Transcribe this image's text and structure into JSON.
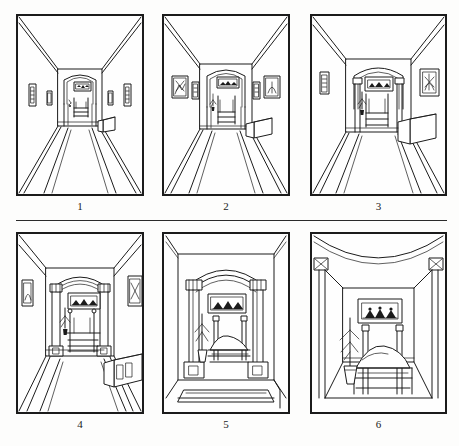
{
  "figure": {
    "style": "black ink line drawing on white",
    "panel_count": 6,
    "columns": 3,
    "rows": 2,
    "ink_color": "#1b1b1b",
    "paper_color": "#fefefe",
    "page_color": "#fdfdfc"
  },
  "panels": [
    {
      "id": "panel-1",
      "caption": "1",
      "scene": "long corridor, distant arched doorway at far end",
      "viewpoint": "farthest from bedroom",
      "elements": [
        "ceiling",
        "left wall",
        "right wall",
        "floor",
        "runner rug",
        "arched doorway",
        "framed picture over bed",
        "bed",
        "four wall pictures",
        "low chest on right"
      ]
    },
    {
      "id": "panel-2",
      "caption": "2",
      "scene": "corridor, one step closer, doorway larger",
      "viewpoint": "approaching",
      "elements": [
        "ceiling",
        "left wall",
        "right wall",
        "floor",
        "runner rug",
        "arched doorway",
        "framed picture over bed",
        "bed",
        "hanging plant",
        "four wall pictures",
        "low chest on right"
      ]
    },
    {
      "id": "panel-3",
      "caption": "3",
      "scene": "corridor, doorway with visible columns and capitals",
      "viewpoint": "closer",
      "elements": [
        "ceiling",
        "left wall",
        "right wall",
        "floor",
        "runner rug",
        "columned arched doorway",
        "framed picture",
        "bed",
        "hanging plant",
        "two wall pictures",
        "chest on right"
      ]
    },
    {
      "id": "panel-4",
      "caption": "4",
      "scene": "doorway fills middle of view, bed clearly visible",
      "viewpoint": "at threshold approach",
      "elements": [
        "ceiling",
        "left wall",
        "right wall",
        "floor",
        "runner rug",
        "columned arched doorway",
        "framed picture",
        "bed with posts",
        "hanging plant",
        "two wall pictures",
        "panelled chest on right"
      ]
    },
    {
      "id": "panel-5",
      "caption": "5",
      "scene": "standing in the doorway, arch and columns frame the bedroom",
      "viewpoint": "in the doorway",
      "elements": [
        "arched header",
        "left column",
        "right column",
        "column bases",
        "framed picture",
        "four-poster bed",
        "hanging plant",
        "rug"
      ]
    },
    {
      "id": "panel-6",
      "caption": "6",
      "scene": "inside the bedroom, bed seen close and large",
      "viewpoint": "inside the room",
      "elements": [
        "vaulted ceiling",
        "corner capitals",
        "back wall",
        "framed picture",
        "four-poster bed with pillow and blanket",
        "hanging plant in pot",
        "floor"
      ]
    }
  ],
  "captions": {
    "p1": "1",
    "p2": "2",
    "p3": "3",
    "p4": "4",
    "p5": "5",
    "p6": "6"
  }
}
